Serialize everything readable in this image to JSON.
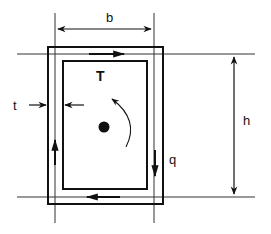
{
  "diagram": {
    "labels": {
      "width": "b",
      "height": "h",
      "thickness": "t",
      "torque": "T",
      "shear_flow": "q"
    },
    "colors": {
      "stroke": "#111111",
      "background": "#ffffff"
    }
  }
}
